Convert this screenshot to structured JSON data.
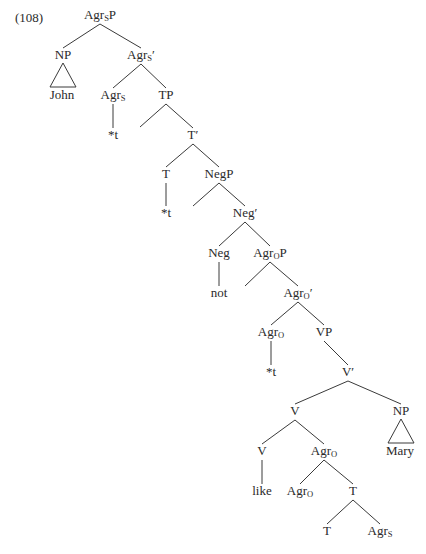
{
  "example_number": "(108)",
  "colors": {
    "ink": "#2a2a2a",
    "line": "#3a3a3a",
    "background": "#ffffff"
  },
  "nodes": [
    {
      "id": "AgrSP",
      "base": "Agr",
      "sub": "S",
      "suffix": "P",
      "x": 100,
      "y": 10
    },
    {
      "id": "NP1",
      "base": "NP",
      "sub": "",
      "suffix": "",
      "x": 63,
      "y": 50
    },
    {
      "id": "John",
      "base": "John",
      "sub": "",
      "suffix": "",
      "x": 62,
      "y": 90
    },
    {
      "id": "AgrSbar",
      "base": "Agr",
      "sub": "S",
      "suffix": "′",
      "x": 141,
      "y": 50
    },
    {
      "id": "AgrS",
      "base": "Agr",
      "sub": "S",
      "suffix": "",
      "x": 113,
      "y": 90
    },
    {
      "id": "t1",
      "base": "*t",
      "sub": "",
      "suffix": "",
      "x": 113,
      "y": 130
    },
    {
      "id": "TP",
      "base": "TP",
      "sub": "",
      "suffix": "",
      "x": 166,
      "y": 90
    },
    {
      "id": "Tbar",
      "base": "T′",
      "sub": "",
      "suffix": "",
      "x": 193,
      "y": 130
    },
    {
      "id": "T1",
      "base": "T",
      "sub": "",
      "suffix": "",
      "x": 166,
      "y": 169
    },
    {
      "id": "t2",
      "base": "*t",
      "sub": "",
      "suffix": "",
      "x": 166,
      "y": 208
    },
    {
      "id": "NegP",
      "base": "NegP",
      "sub": "",
      "suffix": "",
      "x": 219,
      "y": 169
    },
    {
      "id": "Negbar",
      "base": "Neg′",
      "sub": "",
      "suffix": "",
      "x": 245,
      "y": 208
    },
    {
      "id": "Neg",
      "base": "Neg",
      "sub": "",
      "suffix": "",
      "x": 219,
      "y": 248
    },
    {
      "id": "not",
      "base": "not",
      "sub": "",
      "suffix": "",
      "x": 219,
      "y": 288
    },
    {
      "id": "AgrOP",
      "base": "Agr",
      "sub": "O",
      "suffix": "P",
      "x": 270,
      "y": 248
    },
    {
      "id": "AgrObar",
      "base": "Agr",
      "sub": "O",
      "suffix": "′",
      "x": 298,
      "y": 288
    },
    {
      "id": "AgrO1",
      "base": "Agr",
      "sub": "O",
      "suffix": "",
      "x": 271,
      "y": 327
    },
    {
      "id": "t3",
      "base": "*t",
      "sub": "",
      "suffix": "",
      "x": 271,
      "y": 367
    },
    {
      "id": "VP",
      "base": "VP",
      "sub": "",
      "suffix": "",
      "x": 324,
      "y": 327
    },
    {
      "id": "Vbar",
      "base": "V′",
      "sub": "",
      "suffix": "",
      "x": 348,
      "y": 367
    },
    {
      "id": "V1",
      "base": "V",
      "sub": "",
      "suffix": "",
      "x": 295,
      "y": 406
    },
    {
      "id": "NP2",
      "base": "NP",
      "sub": "",
      "suffix": "",
      "x": 401,
      "y": 406
    },
    {
      "id": "Mary",
      "base": "Mary",
      "sub": "",
      "suffix": "",
      "x": 400,
      "y": 446
    },
    {
      "id": "V2",
      "base": "V",
      "sub": "",
      "suffix": "",
      "x": 262,
      "y": 446
    },
    {
      "id": "like",
      "base": "like",
      "sub": "",
      "suffix": "",
      "x": 262,
      "y": 486
    },
    {
      "id": "AgrO2",
      "base": "Agr",
      "sub": "O",
      "suffix": "",
      "x": 324,
      "y": 446
    },
    {
      "id": "AgrO3",
      "base": "Agr",
      "sub": "O",
      "suffix": "",
      "x": 300,
      "y": 486
    },
    {
      "id": "T2",
      "base": "T",
      "sub": "",
      "suffix": "",
      "x": 353,
      "y": 486
    },
    {
      "id": "T3",
      "base": "T",
      "sub": "",
      "suffix": "",
      "x": 327,
      "y": 526
    },
    {
      "id": "AgrS2",
      "base": "Agr",
      "sub": "S",
      "suffix": "",
      "x": 380,
      "y": 526
    }
  ],
  "edges": [
    [
      100,
      24,
      63,
      48
    ],
    [
      100,
      24,
      141,
      48
    ],
    [
      113,
      104,
      113,
      128
    ],
    [
      141,
      64,
      113,
      88
    ],
    [
      141,
      64,
      166,
      88
    ],
    [
      166,
      104,
      140,
      127
    ],
    [
      166,
      104,
      193,
      128
    ],
    [
      193,
      144,
      166,
      167
    ],
    [
      193,
      144,
      219,
      167
    ],
    [
      166,
      183,
      166,
      206
    ],
    [
      219,
      183,
      193,
      206
    ],
    [
      219,
      183,
      245,
      206
    ],
    [
      245,
      222,
      219,
      246
    ],
    [
      245,
      222,
      270,
      246
    ],
    [
      219,
      262,
      219,
      286
    ],
    [
      270,
      262,
      245,
      286
    ],
    [
      270,
      262,
      298,
      286
    ],
    [
      298,
      302,
      271,
      325
    ],
    [
      298,
      302,
      324,
      325
    ],
    [
      271,
      341,
      271,
      365
    ],
    [
      324,
      341,
      348,
      365
    ],
    [
      348,
      381,
      295,
      404
    ],
    [
      348,
      381,
      401,
      404
    ],
    [
      295,
      420,
      262,
      444
    ],
    [
      295,
      420,
      324,
      444
    ],
    [
      262,
      460,
      262,
      484
    ],
    [
      324,
      460,
      300,
      484
    ],
    [
      324,
      460,
      353,
      484
    ],
    [
      353,
      500,
      327,
      524
    ],
    [
      353,
      500,
      380,
      524
    ]
  ],
  "triangles": [
    [
      63,
      63,
      50,
      87,
      76,
      87
    ],
    [
      401,
      419,
      388,
      443,
      414,
      443
    ]
  ]
}
